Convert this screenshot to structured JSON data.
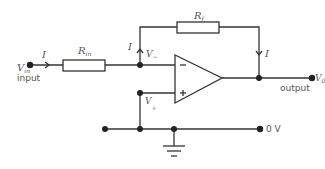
{
  "diagram": {
    "type": "inverting-op-amp-circuit",
    "labels": {
      "vin": "V",
      "vin_sub": "in",
      "input": "input",
      "current": "I",
      "rin": "R",
      "rin_sub": "in",
      "rf": "R",
      "rf_sub": "f",
      "vminus": "V",
      "vminus_sub": "−",
      "vplus": "V",
      "vplus_sub": "+",
      "minus_sign": "−",
      "plus_sign": "+",
      "vo": "V",
      "vo_sub": "0",
      "output": "output",
      "zero_v": "0 V"
    },
    "colors": {
      "wire": "#333333",
      "text": "#555555"
    }
  }
}
